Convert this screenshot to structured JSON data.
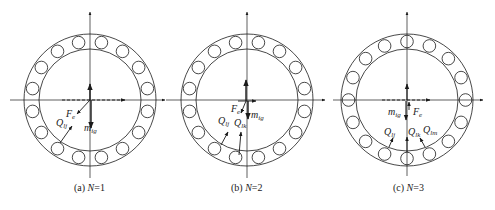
{
  "figure": {
    "panels": [
      {
        "id": "a",
        "caption_prefix": "(a) ",
        "caption_var": "N",
        "caption_value": "=1",
        "center": [
          90,
          100
        ],
        "labels": {
          "Fe": {
            "main": "F",
            "sub": "e"
          },
          "Q1": {
            "main": "Q",
            "sub": "lj"
          },
          "mg": {
            "main": "m",
            "sub": "ig"
          }
        },
        "ball_offset_deg": 11.25
      },
      {
        "id": "b",
        "caption_prefix": "(b) ",
        "caption_var": "N",
        "caption_value": "=2",
        "center": [
          247,
          100
        ],
        "labels": {
          "Fe": {
            "main": "F",
            "sub": "e"
          },
          "Q1": {
            "main": "Q",
            "sub": "lj"
          },
          "Q2": {
            "main": "Q",
            "sub": "lk"
          },
          "mg": {
            "main": "m",
            "sub": "ig"
          }
        },
        "ball_offset_deg": 11.25
      },
      {
        "id": "c",
        "caption_prefix": "(c) ",
        "caption_var": "N",
        "caption_value": "=3",
        "center": [
          407,
          100
        ],
        "labels": {
          "Fe": {
            "main": "F",
            "sub": "e"
          },
          "Q1": {
            "main": "Q",
            "sub": "lj"
          },
          "Q2": {
            "main": "Q",
            "sub": "lk"
          },
          "Q3": {
            "main": "Q",
            "sub": "lm"
          },
          "mg": {
            "main": "m",
            "sub": "ig"
          }
        },
        "ball_offset_deg": 0
      }
    ],
    "geometry": {
      "outer_radius": 66,
      "inner_radius": 51,
      "ball_radius": 6.3,
      "ball_count": 16
    },
    "colors": {
      "line": "#1a1a1a"
    }
  }
}
